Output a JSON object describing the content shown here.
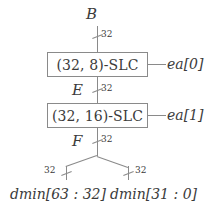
{
  "diagram": {
    "colors": {
      "wire": "#8a8a8a",
      "text": "#3b3b3b",
      "background": "#ffffff"
    },
    "input": {
      "name": "B",
      "width": "32"
    },
    "blocks": [
      {
        "label": "(32, 8)-SLC",
        "enable": "ea[0]"
      },
      {
        "label": "(32, 16)-SLC",
        "enable": "ea[1]"
      }
    ],
    "intermediate_signals": [
      {
        "name": "E",
        "width": "32"
      },
      {
        "name": "F",
        "width": "32"
      }
    ],
    "outputs": [
      {
        "label": "dmin[63 : 32]",
        "width": "32"
      },
      {
        "label": "dmin[31 : 0]",
        "width": "32"
      }
    ]
  }
}
